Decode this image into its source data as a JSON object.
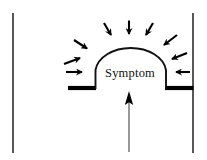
{
  "figure": {
    "title": "",
    "dome_label": "Symptom",
    "colors": {
      "stroke": "#111111",
      "background": "#ffffff",
      "bar": "#000000",
      "arrow": "#000000"
    },
    "elements": {
      "left_wall": {
        "name": "left-vertical-line",
        "x": 13,
        "y1": 13,
        "y2": 153,
        "width": 1.4
      },
      "right_wall": {
        "name": "right-vertical-line",
        "x": 193,
        "y1": 13,
        "y2": 153,
        "width": 1.4
      },
      "left_bar": {
        "name": "left-baseline-bar",
        "x1": 68,
        "x2": 96,
        "y": 88,
        "thickness": 4
      },
      "right_bar": {
        "name": "right-baseline-bar",
        "x1": 165,
        "x2": 193,
        "y": 88,
        "thickness": 4
      },
      "dome": {
        "name": "symptom-dome-arc",
        "left_base_x": 95,
        "right_base_x": 166,
        "base_y": 88,
        "apex_y": 45,
        "stroke_width": 1.8
      },
      "upward_arrow": {
        "name": "upward-pressure-arrow",
        "x": 129,
        "tail_y": 152,
        "tip_y": 91
      }
    },
    "inward_arrows": [
      {
        "name": "inward-arrow-left-horizontal",
        "x1": 66,
        "y1": 72,
        "x2": 86,
        "y2": 72
      },
      {
        "name": "inward-arrow-left-lower",
        "x1": 65,
        "y1": 63,
        "x2": 85,
        "y2": 57
      },
      {
        "name": "inward-arrow-left-upper",
        "x1": 73,
        "y1": 40,
        "x2": 90,
        "y2": 50
      },
      {
        "name": "inward-arrow-top-left",
        "x1": 105,
        "y1": 23,
        "x2": 113,
        "y2": 38
      },
      {
        "name": "inward-arrow-top-center",
        "x1": 129,
        "y1": 21,
        "x2": 129,
        "y2": 38
      },
      {
        "name": "inward-arrow-top-right",
        "x1": 152,
        "y1": 23,
        "x2": 145,
        "y2": 38
      },
      {
        "name": "inward-arrow-right-upper",
        "x1": 176,
        "y1": 35,
        "x2": 162,
        "y2": 46
      },
      {
        "name": "inward-arrow-right-lower",
        "x1": 186,
        "y1": 54,
        "x2": 170,
        "y2": 60
      },
      {
        "name": "inward-arrow-right-horizontal",
        "x1": 190,
        "y1": 72,
        "x2": 173,
        "y2": 72
      }
    ]
  }
}
